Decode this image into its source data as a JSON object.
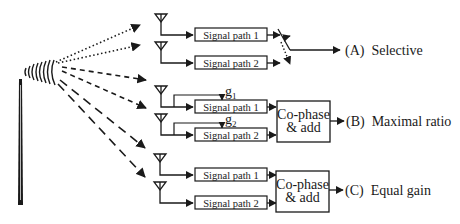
{
  "diagram": {
    "colors": {
      "ink": "#1a1a1a",
      "background": "#ffffff"
    },
    "transmitter": {
      "icon": "transmitter-tower-icon"
    },
    "signal_paths": {
      "path1": "Signal path 1",
      "path2": "Signal path 2"
    },
    "gains": {
      "g1": "g",
      "g1_sub": "1",
      "g2": "g",
      "g2_sub": "2"
    },
    "combiner": {
      "line1": "Co-phase",
      "line2": "& add"
    },
    "schemes": [
      {
        "id": "A",
        "label": "(A)",
        "name": "Selective",
        "line_style": "dotted"
      },
      {
        "id": "B",
        "label": "(B)",
        "name": "Maximal ratio",
        "line_style": "short-dashed"
      },
      {
        "id": "C",
        "label": "(C)",
        "name": "Equal gain",
        "line_style": "long-dashed"
      }
    ]
  }
}
